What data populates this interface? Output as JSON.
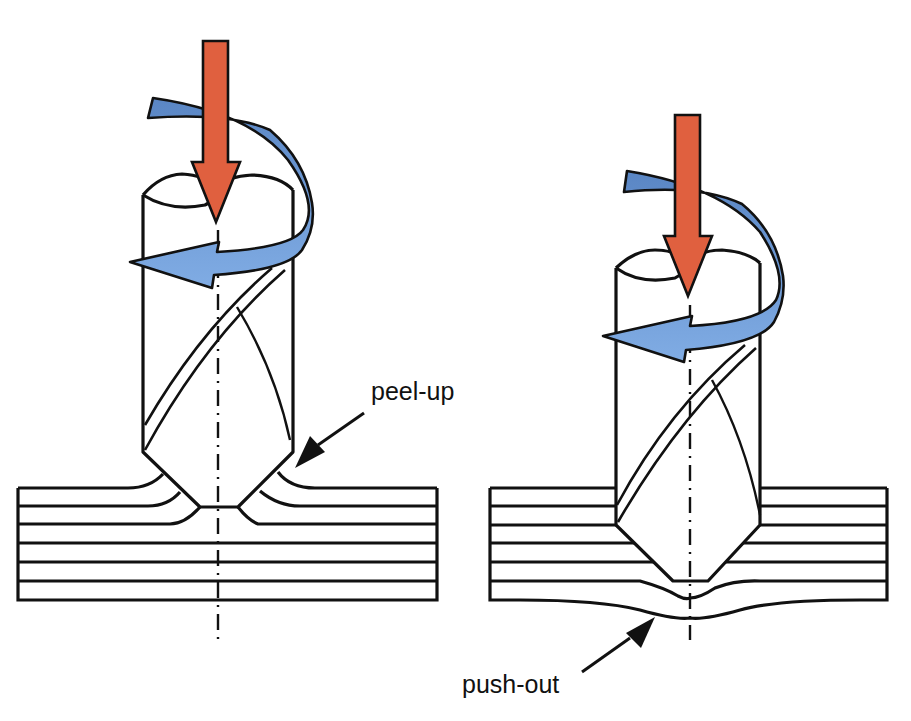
{
  "figure": {
    "colors": {
      "background": "#ffffff",
      "outline": "#111111",
      "feed_arrow": "#e0603f",
      "rotation_arrow_dark": "#5f8bc8",
      "rotation_arrow_light": "#7aa6e0"
    }
  },
  "panels": [
    {
      "id": "left",
      "name": "peel-up drilling entry",
      "label": "peel-up",
      "laminate_layers": 6,
      "arrows": [
        "feed-arrow",
        "rotation-arrow"
      ]
    },
    {
      "id": "right",
      "name": "push-out drilling exit",
      "label": "push-out",
      "laminate_layers": 6,
      "arrows": [
        "feed-arrow",
        "rotation-arrow"
      ]
    }
  ],
  "labels": {
    "peel_up": "peel-up",
    "push_out": "push-out"
  }
}
